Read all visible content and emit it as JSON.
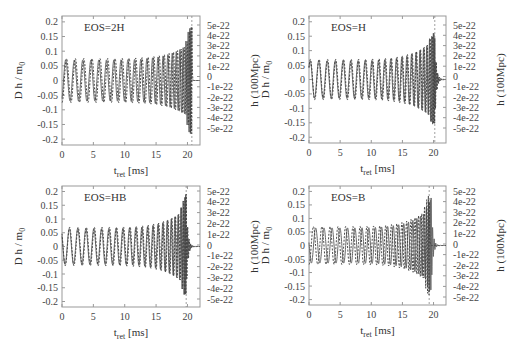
{
  "chart_data": [
    {
      "type": "line",
      "panel": "top-left",
      "annotation": "EOS=2H",
      "xlabel": "t_ret [ms]",
      "xlabel_main": "t",
      "xlabel_sub": "ret",
      "xlabel_unit": " [ms]",
      "ylabel": "D h / m0",
      "ylabel_main": "D h / m",
      "ylabel_sub": "0",
      "y2label": "h (100Mpc)",
      "xlim": [
        0,
        22
      ],
      "ylim": [
        -0.22,
        0.22
      ],
      "x_ticks": [
        "0",
        "5",
        "10",
        "15",
        "20"
      ],
      "y_ticks": [
        "0.2",
        "0.15",
        "0.1",
        "0.05",
        "0",
        "-0.05",
        "-0.1",
        "-0.15",
        "-0.2"
      ],
      "y2_ticks": [
        "5e-22",
        "4e-22",
        "3e-22",
        "2e-22",
        "1e-22",
        "0",
        "-1e-22",
        "-2e-22",
        "-3e-22",
        "-4e-22",
        "-5e-22"
      ],
      "series": [
        {
          "name": "solid",
          "style": "solid",
          "start_amplitude": 0.07,
          "end_amplitude": 0.13,
          "merger_time_ms": 20.5,
          "ringdown": false,
          "peak_amplitude": 0.2
        },
        {
          "name": "dashed",
          "style": "dashed",
          "start_amplitude": 0.075,
          "end_amplitude": 0.13,
          "merger_time_ms": 20.7,
          "ringdown": false,
          "peak_amplitude": 0.2
        }
      ],
      "merger_marker_ms": 20.7
    },
    {
      "type": "line",
      "panel": "top-right",
      "annotation": "EOS=H",
      "xlabel": "t_ret [ms]",
      "xlabel_main": "t",
      "xlabel_sub": "ret",
      "xlabel_unit": " [ms]",
      "ylabel": "D h / m0",
      "ylabel_main": "D h / m",
      "ylabel_sub": "0",
      "y2label": "h (100Mpc)",
      "xlim": [
        0,
        22
      ],
      "ylim": [
        -0.22,
        0.22
      ],
      "x_ticks": [
        "0",
        "5",
        "10",
        "15",
        "20"
      ],
      "y_ticks": [
        "0.2",
        "0.15",
        "0.1",
        "0.05",
        "0",
        "-0.05",
        "-0.1",
        "-0.15",
        "-0.2"
      ],
      "y2_ticks": [
        "5e-22",
        "4e-22",
        "3e-22",
        "2e-22",
        "1e-22",
        "0",
        "-1e-22",
        "-2e-22",
        "-3e-22",
        "-4e-22",
        "-5e-22"
      ],
      "series": [
        {
          "name": "solid",
          "style": "solid",
          "start_amplitude": 0.065,
          "end_amplitude": 0.14,
          "merger_time_ms": 20.1,
          "ringdown": true,
          "peak_amplitude": 0.165
        },
        {
          "name": "dashed",
          "style": "dashed",
          "start_amplitude": 0.07,
          "end_amplitude": 0.14,
          "merger_time_ms": 20.2,
          "ringdown": true,
          "peak_amplitude": 0.165
        }
      ],
      "merger_marker_ms": 20.2
    },
    {
      "type": "line",
      "panel": "bottom-left",
      "annotation": "EOS=HB",
      "xlabel": "t_ret [ms]",
      "xlabel_main": "t",
      "xlabel_sub": "ret",
      "xlabel_unit": " [ms]",
      "ylabel": "D h / m0",
      "ylabel_main": "D h / m",
      "ylabel_sub": "0",
      "y2label": "h (100Mpc)",
      "xlim": [
        0,
        22
      ],
      "ylim": [
        -0.22,
        0.22
      ],
      "x_ticks": [
        "0",
        "5",
        "10",
        "15",
        "20"
      ],
      "y_ticks": [
        "0.2",
        "0.15",
        "0.1",
        "0.05",
        "0",
        "-0.05",
        "-0.1",
        "-0.15",
        "-0.2"
      ],
      "y2_ticks": [
        "5e-22",
        "4e-22",
        "3e-22",
        "2e-22",
        "1e-22",
        "0",
        "-1e-22",
        "-2e-22",
        "-3e-22",
        "-4e-22",
        "-5e-22"
      ],
      "series": [
        {
          "name": "solid",
          "style": "solid",
          "start_amplitude": 0.065,
          "end_amplitude": 0.14,
          "merger_time_ms": 19.7,
          "ringdown": true,
          "peak_amplitude": 0.19
        },
        {
          "name": "dashed",
          "style": "dashed",
          "start_amplitude": 0.07,
          "end_amplitude": 0.14,
          "merger_time_ms": 19.8,
          "ringdown": true,
          "peak_amplitude": 0.19
        }
      ],
      "merger_marker_ms": 19.8
    },
    {
      "type": "line",
      "panel": "bottom-right",
      "annotation": "EOS=B",
      "xlabel": "t_ret [ms]",
      "xlabel_main": "t",
      "xlabel_sub": "ret",
      "xlabel_unit": " [ms]",
      "ylabel": "D h / m0",
      "ylabel_main": "D h / m",
      "ylabel_sub": "0",
      "y2label": "h (100Mpc)",
      "xlim": [
        0,
        22
      ],
      "ylim": [
        -0.22,
        0.22
      ],
      "x_ticks": [
        "0",
        "5",
        "10",
        "15",
        "20"
      ],
      "y_ticks": [
        "0.2",
        "0.15",
        "0.1",
        "0.05",
        "0",
        "-0.05",
        "-0.1",
        "-0.15",
        "-0.2"
      ],
      "y2_ticks": [
        "5e-22",
        "4e-22",
        "3e-22",
        "2e-22",
        "1e-22",
        "0",
        "-1e-22",
        "-2e-22",
        "-3e-22",
        "-4e-22",
        "-5e-22"
      ],
      "series": [
        {
          "name": "solid",
          "style": "solid",
          "start_amplitude": 0.065,
          "end_amplitude": 0.14,
          "merger_time_ms": 19.6,
          "ringdown": true,
          "peak_amplitude": 0.18
        },
        {
          "name": "dashed",
          "style": "dashed",
          "start_amplitude": 0.07,
          "end_amplitude": 0.14,
          "merger_time_ms": 19.3,
          "ringdown": false,
          "peak_amplitude": 0.2
        }
      ],
      "merger_marker_ms": 19.3
    }
  ]
}
